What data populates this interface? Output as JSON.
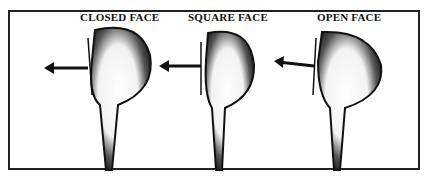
{
  "diagram": {
    "panels": [
      {
        "label": "CLOSED FACE",
        "face_angle": "closed"
      },
      {
        "label": "SQUARE FACE",
        "face_angle": "square"
      },
      {
        "label": "OPEN FACE",
        "face_angle": "open"
      }
    ],
    "arrow_direction": "left",
    "colors": {
      "ink": "#1a1a1a",
      "paper": "#ffffff"
    }
  }
}
